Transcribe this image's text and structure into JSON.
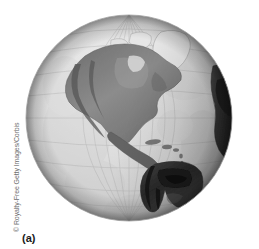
{
  "figure": {
    "caption": "(a)",
    "photo_credit": "© Royalty-Free Getty Images/Corbis",
    "alt_description": "Grayscale satellite-style view of the Earth globe centered on the Americas",
    "colors": {
      "background": "#ffffff",
      "ocean": "#e5e5e5",
      "ocean_deep": "#d2d2d2",
      "land_mid": "#8a8a8a",
      "land_dark": "#3a3a3a",
      "land_darkest": "#141414",
      "ice_white": "#f4f4f4",
      "limb_shadow": "#6a6a6a",
      "graticule": "#b4b4b4",
      "credit_text": "#6e6e6e",
      "caption_text": "#1a1a1a"
    },
    "geometry": {
      "globe_center_x": 104,
      "globe_center_y": 104,
      "globe_radius": 103
    },
    "landmasses": [
      {
        "name": "north-america"
      },
      {
        "name": "greenland"
      },
      {
        "name": "central-america"
      },
      {
        "name": "south-america"
      },
      {
        "name": "west-africa"
      },
      {
        "name": "caribbean-islands"
      }
    ],
    "graticule": {
      "meridian_count": 9,
      "parallel_count": 9,
      "visible": true
    }
  }
}
